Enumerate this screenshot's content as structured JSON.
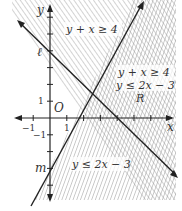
{
  "figure": {
    "title": "",
    "axes": {
      "x_label": "x",
      "y_label": "y",
      "origin_label": "O",
      "tick_labels": {
        "x_pos_one": "1",
        "x_neg_one": "−1",
        "y_pos_one": "1",
        "y_neg_one": "−1"
      },
      "x_ticks": [
        -1,
        1,
        2,
        3,
        4,
        5,
        6
      ],
      "y_ticks": [
        -4,
        -3,
        -2,
        -1,
        1,
        2,
        3,
        4,
        5,
        6,
        7
      ],
      "x_range": [
        -2.3,
        7.5
      ],
      "y_range": [
        -5,
        7
      ]
    },
    "lines": [
      {
        "name": "ℓ",
        "equation": "y + x = 4",
        "y_intercept": 4
      },
      {
        "name": "m",
        "equation": "y = 2x − 3",
        "y_intercept": -3
      }
    ],
    "regions": {
      "upper_left": {
        "label": "y + x ≥ 4"
      },
      "right": {
        "line1": "y + x ≥ 4",
        "line2": "y ≤ 2x − 3",
        "name": "R"
      },
      "lower": {
        "label": "y ≤ 2x − 3"
      }
    },
    "intersection": {
      "x": 2.333,
      "y": 1.667
    },
    "colors": {
      "line": "#222222",
      "hatch": "#9a9a9a",
      "text": "#333333",
      "background": "#ffffff"
    }
  }
}
